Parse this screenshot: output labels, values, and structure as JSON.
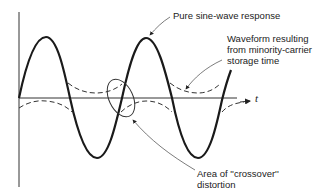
{
  "diagram": {
    "type": "waveform-annotation",
    "axis": {
      "time_label": "t"
    },
    "curves": [
      {
        "name": "pure-sine-wave",
        "style": "solid-thick"
      },
      {
        "name": "storage-time-waveform",
        "style": "dashed"
      }
    ],
    "annotations": {
      "sine_label": "Pure sine-wave response",
      "storage_label_line1": "Waveform resulting",
      "storage_label_line2": "from minority-carrier",
      "storage_label_line3": "storage time",
      "crossover_label_line1": "Area of ''crossover''",
      "crossover_label_line2": "distortion"
    },
    "colors": {
      "ink": "#222222",
      "background": "#ffffff"
    }
  }
}
